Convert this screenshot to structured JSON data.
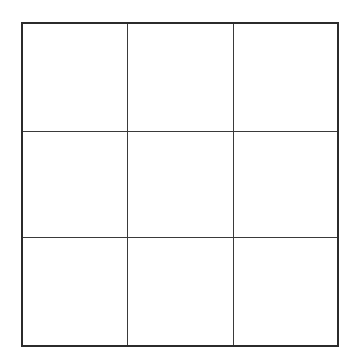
{
  "diagram": {
    "type": "grid",
    "rows": 3,
    "columns": 3,
    "cells": [
      [
        "",
        "",
        ""
      ],
      [
        "",
        "",
        ""
      ],
      [
        "",
        "",
        ""
      ]
    ],
    "colors": {
      "background": "#ffffff",
      "border": "#2b2b2b",
      "grid_line": "#3a3a3a"
    }
  }
}
